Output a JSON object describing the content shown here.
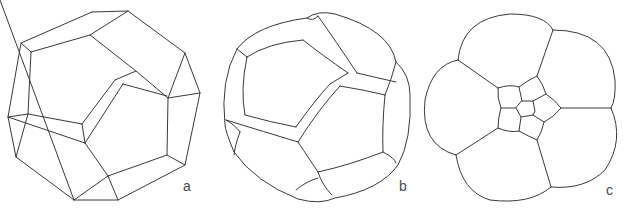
{
  "figure": {
    "panels": [
      {
        "id": "a",
        "label": "a",
        "description": "dodecahedron, straight edges"
      },
      {
        "id": "b",
        "label": "b",
        "description": "rounded dodecahedron, curved edges"
      },
      {
        "id": "c",
        "label": "c",
        "description": "projected cell arrangement with central pentagon"
      }
    ]
  },
  "style": {
    "line_color": "#3a3a3a",
    "background": "#ffffff",
    "label_color": "#4a4a4a"
  }
}
